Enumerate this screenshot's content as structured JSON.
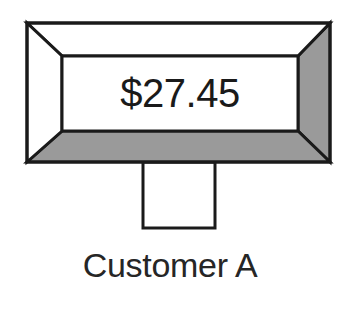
{
  "diagram": {
    "type": "beveled-sign-on-post",
    "background_color": "#ffffff",
    "sign": {
      "name": "beveled-display-frame",
      "amount_value": "$27.45",
      "face_fill": "#ffffff",
      "bevel_highlight_color": "#ffffff",
      "bevel_shadow_color": "#9a9a9a",
      "outline_color": "#1a1a1a",
      "outline_width": 3,
      "outer_rect": {
        "x": 27,
        "y": 23,
        "width": 303,
        "height": 139
      },
      "inner_rect": {
        "x": 62,
        "y": 56,
        "width": 236,
        "height": 75
      },
      "bevel_faces": [
        {
          "name": "bevel-face-top",
          "shade": "highlight",
          "fill": "#ffffff"
        },
        {
          "name": "bevel-face-left",
          "shade": "highlight",
          "fill": "#ffffff"
        },
        {
          "name": "bevel-face-right",
          "shade": "shadow",
          "fill": "#9a9a9a"
        },
        {
          "name": "bevel-face-bottom",
          "shade": "shadow",
          "fill": "#9a9a9a"
        }
      ]
    },
    "post": {
      "name": "sign-post",
      "fill": "#ffffff",
      "outline_color": "#1a1a1a",
      "rect": {
        "x": 143,
        "y": 162,
        "width": 72,
        "height": 66
      }
    },
    "caption": {
      "name": "customer-label",
      "text": "Customer A",
      "color": "#262626",
      "center_x": 170,
      "baseline_y": 277
    }
  }
}
